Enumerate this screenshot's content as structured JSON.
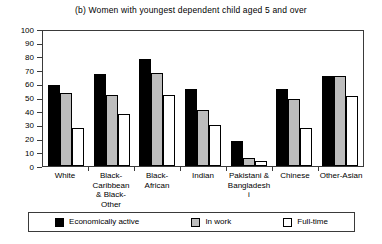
{
  "chart_data": {
    "type": "bar",
    "title": "(b) Women with youngest dependent child aged 5 and over",
    "xlabel": "",
    "ylabel": "",
    "ylim": [
      0,
      100
    ],
    "yticks": [
      0,
      10,
      20,
      30,
      40,
      50,
      60,
      70,
      80,
      90,
      100
    ],
    "grid": false,
    "legend_position": "bottom",
    "categories": [
      "White",
      "Black-Caribbean & Black-Other",
      "Black-African",
      "Indian",
      "Pakistani & Bangladeshi",
      "Chinese",
      "Other-Asian"
    ],
    "series": [
      {
        "name": "Economically active",
        "color": "#000000",
        "values": [
          59,
          67,
          78,
          56,
          18,
          56,
          66
        ]
      },
      {
        "name": "In work",
        "color": "#bdbdbd",
        "values": [
          53,
          52,
          68,
          41,
          6,
          49,
          66
        ]
      },
      {
        "name": "Full-time",
        "color": "#ffffff",
        "values": [
          28,
          38,
          52,
          30,
          4,
          28,
          51
        ]
      }
    ]
  }
}
